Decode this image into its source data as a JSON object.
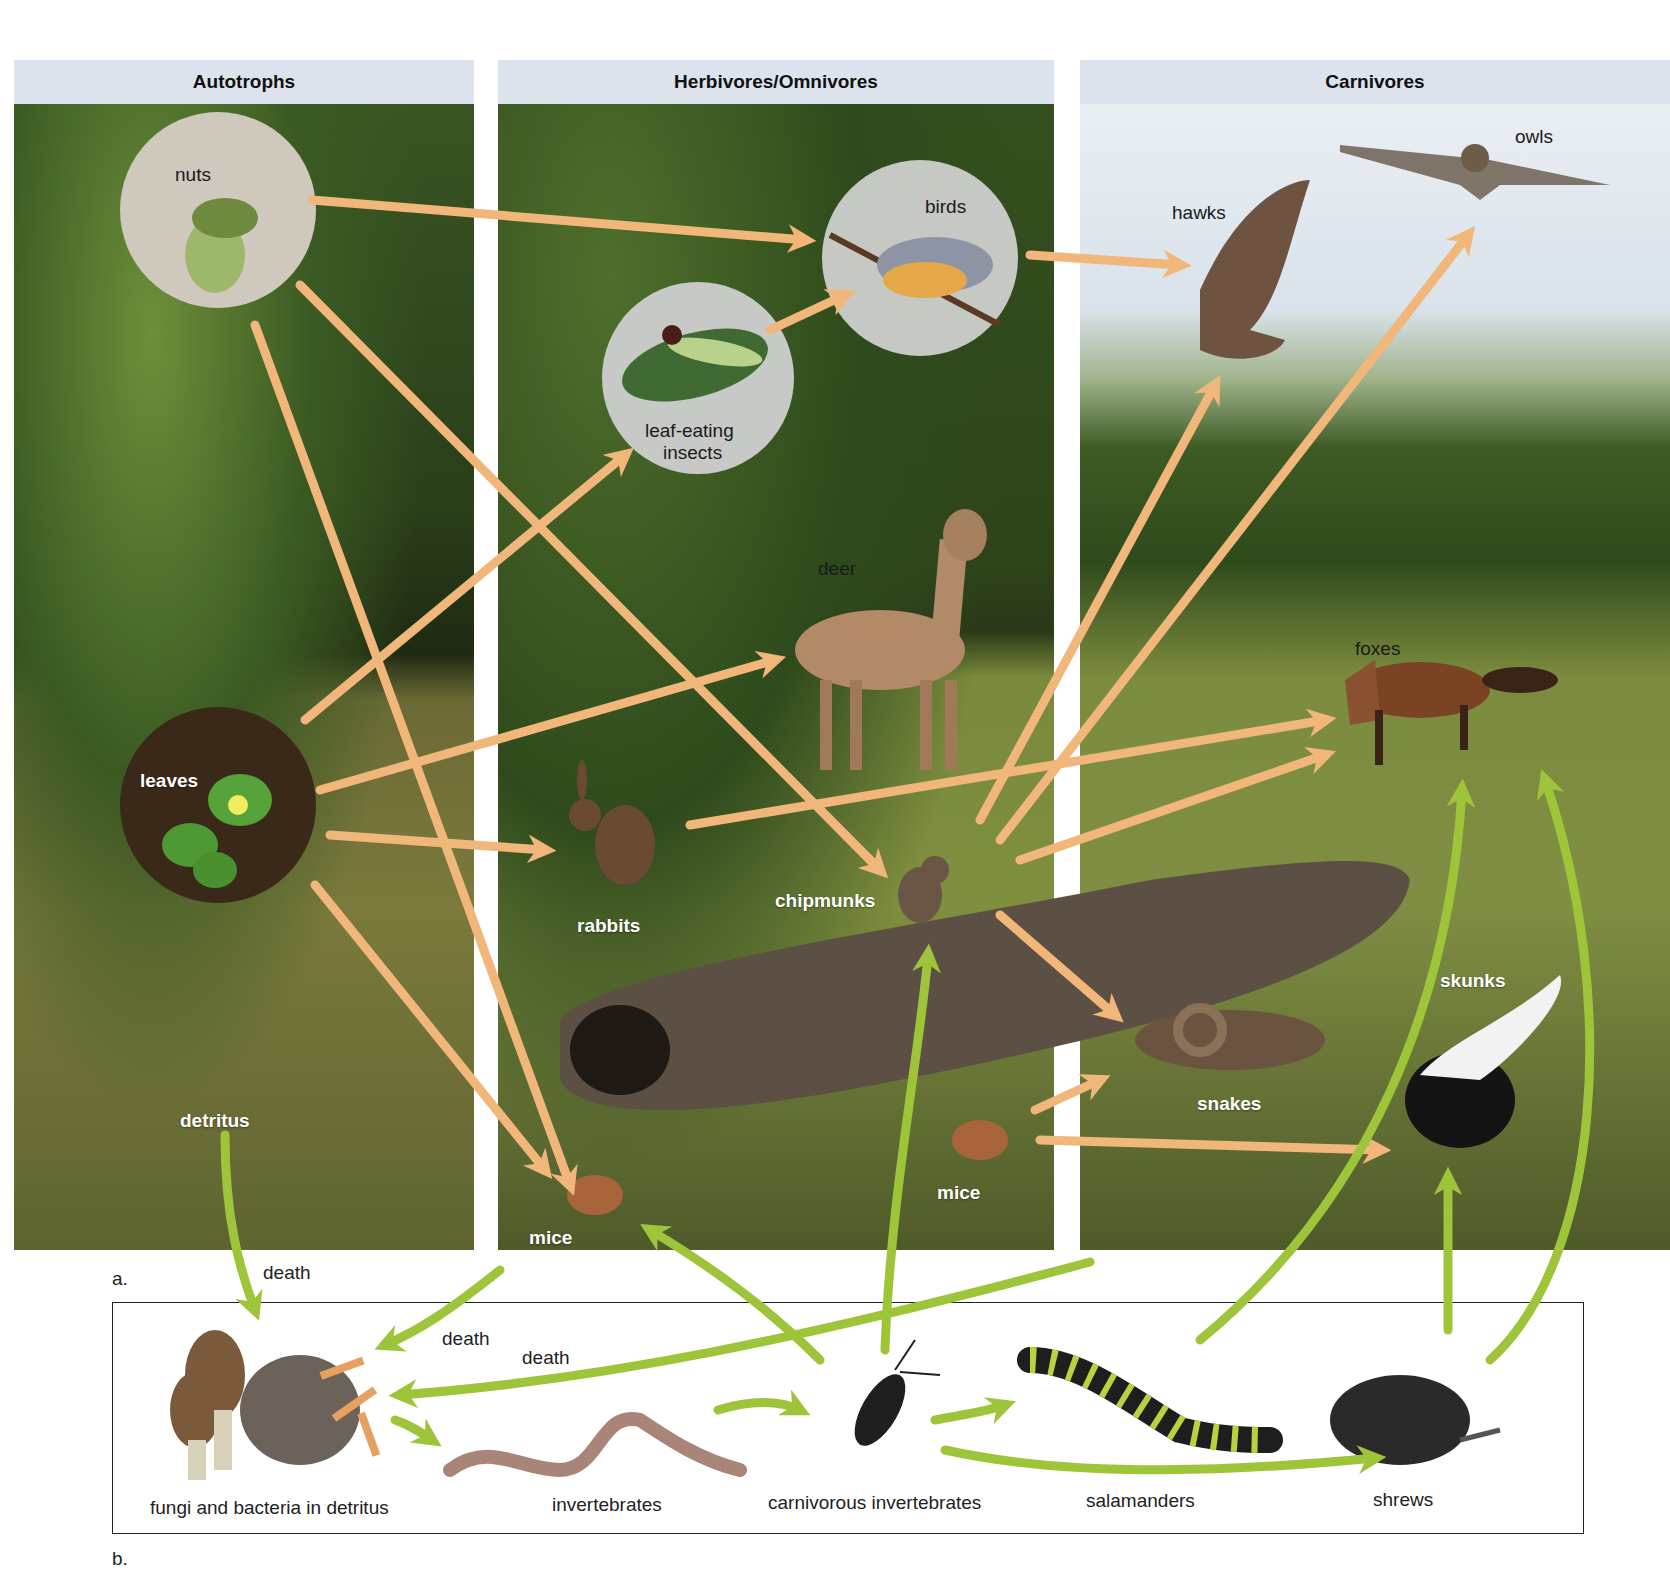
{
  "panels": {
    "autotrophs": "Autotrophs",
    "herbivores": "Herbivores/Omnivores",
    "carnivores": "Carnivores"
  },
  "organisms": {
    "nuts": "nuts",
    "leaves": "leaves",
    "detritus": "detritus",
    "birds": "birds",
    "leaf_eating_insects_line1": "leaf-eating",
    "leaf_eating_insects_line2": "insects",
    "deer": "deer",
    "rabbits": "rabbits",
    "chipmunks": "chipmunks",
    "mice_left": "mice",
    "mice_right": "mice",
    "hawks": "hawks",
    "owls": "owls",
    "foxes": "foxes",
    "snakes": "snakes",
    "skunks": "skunks"
  },
  "part_labels": {
    "a": "a.",
    "b": "b."
  },
  "detritus_web": {
    "fungi": "fungi and bacteria in detritus",
    "invertebrates": "invertebrates",
    "carnivorous_invertebrates": "carnivorous invertebrates",
    "salamanders": "salamanders",
    "shrews": "shrews"
  },
  "death_labels": [
    "death",
    "death",
    "death"
  ],
  "colors": {
    "grazing_arrow": "#f0b67a",
    "detrital_arrow": "#9ec43a",
    "header_bg": "#dde3ec"
  },
  "links": {
    "grazing": [
      [
        "nuts",
        "birds"
      ],
      [
        "nuts",
        "chipmunks"
      ],
      [
        "nuts",
        "mice_left"
      ],
      [
        "leaves",
        "leaf-eating insects"
      ],
      [
        "leaves",
        "deer"
      ],
      [
        "leaves",
        "rabbits"
      ],
      [
        "leaves",
        "mice_left"
      ],
      [
        "leaf-eating insects",
        "birds"
      ],
      [
        "birds",
        "hawks"
      ],
      [
        "rabbits",
        "foxes"
      ],
      [
        "chipmunks",
        "foxes"
      ],
      [
        "chipmunks",
        "hawks"
      ],
      [
        "chipmunks",
        "owls"
      ],
      [
        "chipmunks",
        "snakes"
      ],
      [
        "mice_right",
        "snakes"
      ],
      [
        "mice_right",
        "skunks"
      ]
    ],
    "detrital": [
      [
        "detritus",
        "fungi and bacteria"
      ],
      [
        "fungi and bacteria",
        "invertebrates"
      ],
      [
        "invertebrates",
        "carnivorous invertebrates"
      ],
      [
        "carnivorous invertebrates",
        "salamanders"
      ],
      [
        "carnivorous invertebrates",
        "shrews"
      ],
      [
        "carnivorous invertebrates",
        "chipmunks"
      ],
      [
        "carnivorous invertebrates",
        "mice_left"
      ],
      [
        "salamanders",
        "foxes"
      ],
      [
        "shrews",
        "skunks"
      ],
      [
        "shrews",
        "foxes"
      ]
    ]
  }
}
